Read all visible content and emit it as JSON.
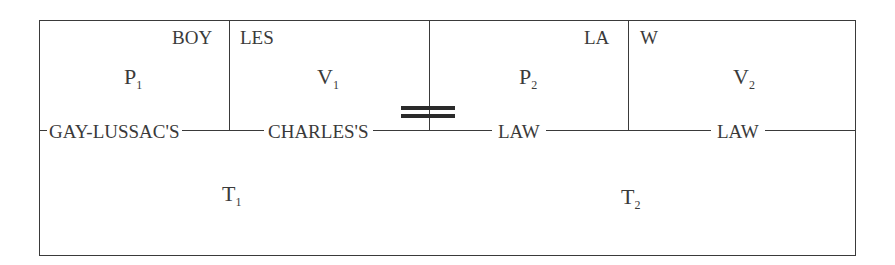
{
  "diagram": {
    "title_fragments": {
      "boy": "BOY",
      "les": "LES",
      "la": "LA",
      "w": "W"
    },
    "variables": {
      "p1": {
        "letter": "P",
        "sub": "1"
      },
      "v1": {
        "letter": "V",
        "sub": "1"
      },
      "p2": {
        "letter": "P",
        "sub": "2"
      },
      "v2": {
        "letter": "V",
        "sub": "2"
      },
      "t1": {
        "letter": "T",
        "sub": "1"
      },
      "t2": {
        "letter": "T",
        "sub": "2"
      }
    },
    "law_labels": {
      "gay_lussac": "GAY-LUSSAC'S",
      "charles": "CHARLES'S",
      "law_left": "LAW",
      "law_right": "LAW"
    },
    "equals_icon": "equals-sign"
  }
}
